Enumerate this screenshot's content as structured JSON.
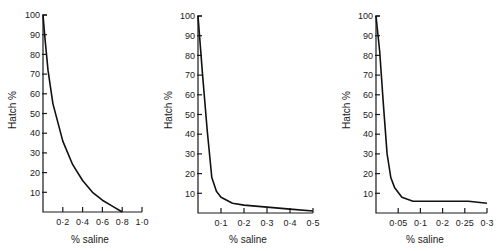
{
  "chart_data": [
    {
      "type": "line",
      "title": "",
      "xlabel": "% saline",
      "ylabel": "Hatch %",
      "xlim": [
        0,
        1.0
      ],
      "ylim": [
        0,
        100
      ],
      "x_ticks": [
        "0·2",
        "0·4",
        "0·6",
        "0·8",
        "1·0"
      ],
      "x_tick_values": [
        0.2,
        0.4,
        0.6,
        0.8,
        1.0
      ],
      "y_ticks": [
        "10",
        "20",
        "30",
        "40",
        "50",
        "60",
        "70",
        "80",
        "90",
        "100"
      ],
      "grid": false,
      "series": [
        {
          "name": "Hatch %",
          "x": [
            0,
            0.02,
            0.05,
            0.1,
            0.2,
            0.3,
            0.4,
            0.5,
            0.6,
            0.7,
            0.8
          ],
          "y": [
            100,
            88,
            72,
            55,
            36,
            24,
            16,
            10,
            6,
            3,
            0
          ]
        }
      ]
    },
    {
      "type": "line",
      "title": "",
      "xlabel": "% saline",
      "ylabel": "Hatch %",
      "xlim": [
        0,
        0.5
      ],
      "ylim": [
        0,
        100
      ],
      "x_ticks": [
        "0·1",
        "0·2",
        "0·3",
        "0·4",
        "0·5"
      ],
      "x_tick_values": [
        0.1,
        0.2,
        0.3,
        0.4,
        0.5
      ],
      "y_ticks": [
        "10",
        "20",
        "30",
        "40",
        "50",
        "60",
        "70",
        "80",
        "90",
        "100"
      ],
      "grid": false,
      "series": [
        {
          "name": "Hatch %",
          "x": [
            0,
            0.02,
            0.04,
            0.06,
            0.08,
            0.1,
            0.15,
            0.2,
            0.3,
            0.4,
            0.5
          ],
          "y": [
            100,
            70,
            42,
            18,
            11,
            8,
            5,
            4,
            3,
            2,
            1
          ]
        }
      ]
    },
    {
      "type": "line",
      "title": "",
      "xlabel": "% saline",
      "ylabel": "Hatch %",
      "xlim": [
        0,
        0.3
      ],
      "ylim": [
        0,
        100
      ],
      "x_ticks": [
        "0·05",
        "0·1",
        "0·2",
        "0·25",
        "0·3"
      ],
      "x_tick_values": [
        0.05,
        0.1,
        0.15,
        0.2,
        0.25
      ],
      "y_ticks": [
        "10",
        "20",
        "30",
        "40",
        "50",
        "60",
        "70",
        "80",
        "90",
        "100"
      ],
      "grid": false,
      "series": [
        {
          "name": "Hatch %",
          "x": [
            0,
            0.01,
            0.02,
            0.03,
            0.04,
            0.05,
            0.07,
            0.1,
            0.15,
            0.2,
            0.25,
            0.3
          ],
          "y": [
            100,
            82,
            55,
            30,
            18,
            13,
            8,
            6,
            6,
            6,
            6,
            5
          ]
        }
      ]
    }
  ],
  "labels": {
    "ylabel": "Hatch %",
    "xlabel": "% saline"
  }
}
